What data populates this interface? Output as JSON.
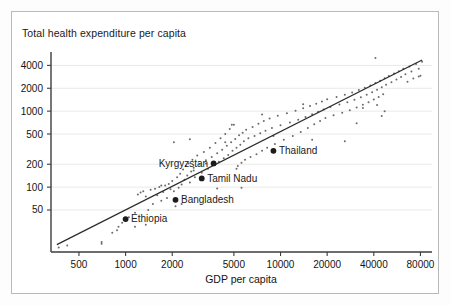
{
  "chart_data": {
    "type": "scatter",
    "title": "Total health expenditure per capita",
    "xlabel": "GDP per capita",
    "ylabel": "",
    "xscale": "log",
    "yscale": "log",
    "xlim": [
      330,
      95000
    ],
    "ylim": [
      14,
      6000
    ],
    "grid": true,
    "legend": null,
    "xticks": [
      500,
      1000,
      2000,
      5000,
      10000,
      20000,
      40000,
      80000
    ],
    "xticklabels": [
      "500",
      "1000",
      "2000",
      "5000",
      "10000",
      "20000",
      "40000",
      "80000"
    ],
    "yticks": [
      50,
      100,
      200,
      500,
      1000,
      2000,
      4000
    ],
    "yticklabels": [
      "50",
      "100",
      "200",
      "500",
      "1000",
      "2000",
      "4000"
    ],
    "trendline": {
      "label": "fit-line",
      "x": [
        360,
        82000
      ],
      "y": [
        17.5,
        4700
      ]
    },
    "annotated_points": [
      {
        "name": "Ethiopia",
        "x": 1000,
        "y": 38,
        "label_side": "right"
      },
      {
        "name": "Bangladesh",
        "x": 2100,
        "y": 68,
        "label_side": "right"
      },
      {
        "name": "Tamil Nadu",
        "x": 3100,
        "y": 130,
        "label_side": "right"
      },
      {
        "name": "Kyrgyzstan",
        "x": 3700,
        "y": 205,
        "label_side": "left"
      },
      {
        "name": "Thailand",
        "x": 9000,
        "y": 300,
        "label_side": "right"
      }
    ],
    "points": [
      [
        370,
        16
      ],
      [
        420,
        17
      ],
      [
        700,
        19
      ],
      [
        820,
        25
      ],
      [
        880,
        27
      ],
      [
        900,
        30
      ],
      [
        950,
        34
      ],
      [
        1050,
        40
      ],
      [
        1150,
        46
      ],
      [
        1200,
        80
      ],
      [
        1250,
        85
      ],
      [
        1300,
        88
      ],
      [
        1350,
        75
      ],
      [
        1400,
        50
      ],
      [
        1450,
        92
      ],
      [
        1500,
        60
      ],
      [
        1550,
        95
      ],
      [
        1600,
        78
      ],
      [
        1650,
        100
      ],
      [
        1700,
        66
      ],
      [
        1750,
        86
      ],
      [
        1800,
        105
      ],
      [
        1850,
        72
      ],
      [
        1900,
        110
      ],
      [
        1950,
        94
      ],
      [
        2000,
        120
      ],
      [
        2050,
        88
      ],
      [
        2100,
        56
      ],
      [
        2150,
        135
      ],
      [
        2200,
        98
      ],
      [
        2250,
        150
      ],
      [
        2300,
        108
      ],
      [
        2350,
        170
      ],
      [
        2400,
        125
      ],
      [
        2450,
        190
      ],
      [
        2500,
        142
      ],
      [
        2550,
        205
      ],
      [
        2600,
        115
      ],
      [
        2650,
        160
      ],
      [
        2700,
        230
      ],
      [
        2750,
        180
      ],
      [
        2800,
        135
      ],
      [
        2900,
        260
      ],
      [
        3000,
        200
      ],
      [
        3100,
        155
      ],
      [
        3200,
        290
      ],
      [
        3300,
        225
      ],
      [
        3400,
        175
      ],
      [
        3500,
        330
      ],
      [
        3600,
        250
      ],
      [
        3700,
        195
      ],
      [
        3800,
        380
      ],
      [
        3900,
        280
      ],
      [
        4000,
        215
      ],
      [
        4100,
        440
      ],
      [
        4200,
        310
      ],
      [
        4300,
        240
      ],
      [
        4400,
        500
      ],
      [
        4500,
        350
      ],
      [
        4600,
        265
      ],
      [
        4700,
        580
      ],
      [
        4800,
        390
      ],
      [
        4900,
        300
      ],
      [
        5000,
        660
      ],
      [
        5100,
        430
      ],
      [
        5200,
        330
      ],
      [
        5300,
        190
      ],
      [
        5400,
        480
      ],
      [
        5500,
        360
      ],
      [
        5600,
        210
      ],
      [
        5700,
        520
      ],
      [
        5800,
        400
      ],
      [
        5900,
        230
      ],
      [
        6000,
        570
      ],
      [
        6200,
        440
      ],
      [
        6400,
        250
      ],
      [
        6600,
        620
      ],
      [
        6800,
        470
      ],
      [
        7000,
        270
      ],
      [
        7200,
        680
      ],
      [
        7400,
        510
      ],
      [
        7600,
        300
      ],
      [
        7800,
        740
      ],
      [
        8000,
        550
      ],
      [
        8200,
        330
      ],
      [
        8500,
        800
      ],
      [
        8800,
        600
      ],
      [
        9200,
        370
      ],
      [
        9600,
        870
      ],
      [
        10000,
        650
      ],
      [
        10500,
        420
      ],
      [
        11000,
        940
      ],
      [
        11500,
        710
      ],
      [
        12000,
        470
      ],
      [
        12500,
        1010
      ],
      [
        13000,
        770
      ],
      [
        13500,
        530
      ],
      [
        14000,
        1090
      ],
      [
        14500,
        840
      ],
      [
        15000,
        600
      ],
      [
        15500,
        1170
      ],
      [
        16000,
        910
      ],
      [
        16500,
        670
      ],
      [
        17000,
        1250
      ],
      [
        17500,
        980
      ],
      [
        18000,
        740
      ],
      [
        18500,
        1340
      ],
      [
        19000,
        1050
      ],
      [
        19500,
        810
      ],
      [
        20000,
        1430
      ],
      [
        21000,
        1130
      ],
      [
        22000,
        880
      ],
      [
        23000,
        1530
      ],
      [
        24000,
        1220
      ],
      [
        25000,
        950
      ],
      [
        26000,
        1640
      ],
      [
        27000,
        1310
      ],
      [
        28000,
        1030
      ],
      [
        29000,
        1760
      ],
      [
        30000,
        1410
      ],
      [
        31000,
        1120
      ],
      [
        32000,
        1890
      ],
      [
        33000,
        1520
      ],
      [
        34000,
        1210
      ],
      [
        35000,
        2030
      ],
      [
        36000,
        1640
      ],
      [
        37000,
        1310
      ],
      [
        38000,
        2180
      ],
      [
        39000,
        1770
      ],
      [
        40000,
        1420
      ],
      [
        41000,
        2340
      ],
      [
        42000,
        1910
      ],
      [
        43000,
        1540
      ],
      [
        44000,
        2510
      ],
      [
        45000,
        2060
      ],
      [
        46000,
        1670
      ],
      [
        47000,
        2700
      ],
      [
        48000,
        2220
      ],
      [
        50000,
        2900
      ],
      [
        52000,
        2400
      ],
      [
        54000,
        3120
      ],
      [
        56000,
        2600
      ],
      [
        58000,
        3350
      ],
      [
        60000,
        2820
      ],
      [
        62000,
        3600
      ],
      [
        64000,
        3060
      ],
      [
        66000,
        2440
      ],
      [
        68000,
        3870
      ],
      [
        70000,
        3320
      ],
      [
        72000,
        2680
      ],
      [
        75000,
        4160
      ],
      [
        78000,
        3600
      ],
      [
        80000,
        2920
      ],
      [
        82000,
        4470
      ],
      [
        2050,
        390
      ],
      [
        2600,
        425
      ],
      [
        4850,
        660
      ],
      [
        5600,
        98
      ],
      [
        7600,
        900
      ],
      [
        9000,
        470
      ],
      [
        14000,
        1230
      ],
      [
        16000,
        420
      ],
      [
        26000,
        400
      ],
      [
        31000,
        690
      ],
      [
        34000,
        1100
      ],
      [
        41000,
        5000
      ],
      [
        42000,
        1200
      ],
      [
        45000,
        860
      ],
      [
        47000,
        1000
      ],
      [
        78000,
        2850
      ],
      [
        700,
        18
      ],
      [
        1150,
        30
      ],
      [
        1350,
        32
      ],
      [
        1700,
        105
      ],
      [
        2300,
        60
      ],
      [
        2750,
        165
      ],
      [
        3300,
        205
      ],
      [
        3900,
        96
      ],
      [
        4400,
        390
      ],
      [
        5200,
        175
      ]
    ]
  }
}
